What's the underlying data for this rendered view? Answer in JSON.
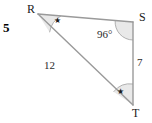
{
  "problem": {
    "number": "5"
  },
  "figure": {
    "type": "triangle",
    "vertices": [
      {
        "name": "R",
        "label": "R",
        "x": 38,
        "y": 14
      },
      {
        "name": "S",
        "label": "S",
        "x": 133,
        "y": 22
      },
      {
        "name": "T",
        "label": "T",
        "x": 133,
        "y": 105
      }
    ],
    "sides": [
      {
        "name": "RS",
        "from": "R",
        "to": "S",
        "label": ""
      },
      {
        "name": "ST",
        "from": "S",
        "to": "T",
        "label": "7"
      },
      {
        "name": "RT",
        "from": "R",
        "to": "T",
        "label": "12"
      }
    ],
    "angles": [
      {
        "at": "R",
        "label": "",
        "mark": "star"
      },
      {
        "at": "S",
        "label": "96°",
        "mark": "arc"
      },
      {
        "at": "T",
        "label": "",
        "mark": "star"
      }
    ],
    "marks": {
      "star_glyph": "★",
      "congruent_angles": "R and T"
    },
    "colors": {
      "line": "#9a9a9a",
      "arc": "#b0b0b0",
      "arc_fill": "#e8e8e8",
      "text": "#1a1a1a",
      "background": "#ffffff"
    }
  }
}
